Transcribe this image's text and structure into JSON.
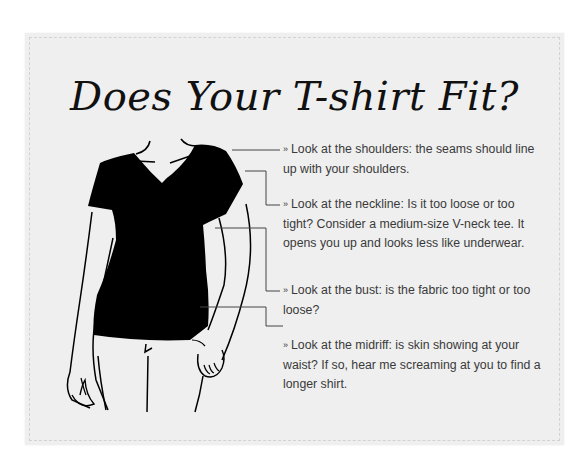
{
  "title": "Does Your T-shirt Fit?",
  "bullet_glyph": "»",
  "tips": [
    {
      "id": "shoulders",
      "text": "Look at the shoulders: the seams should line up with your shoulders."
    },
    {
      "id": "neckline",
      "text": "Look at the neckline: Is it too loose or too tight? Consider a medium-size V-neck tee. It opens you up and looks less like underwear."
    },
    {
      "id": "bust",
      "text": "Look at the bust: is the fabric too tight or too loose?"
    },
    {
      "id": "midriff",
      "text": "Look at the midriff: is skin showing at your waist? If so, hear me screaming at you to find a longer shirt."
    }
  ],
  "colors": {
    "card": "#efefef",
    "shirt": "#000000",
    "text": "#3a3a3a"
  }
}
